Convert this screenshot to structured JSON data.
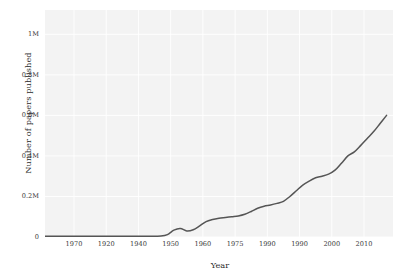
{
  "chart_data": {
    "type": "line",
    "title": "",
    "xlabel": "Year",
    "ylabel": "Number of papers published",
    "xlim": [
      1962,
      2016
    ],
    "ylim": [
      0,
      1120000
    ],
    "grid": true,
    "legend": "none",
    "series_color": "#555555",
    "panel_background": "#f3f3f3",
    "grid_color": "#ffffff",
    "xticks": [
      1970,
      1920,
      1940,
      1950,
      1960,
      1975,
      1990,
      1990,
      2000,
      2010
    ],
    "xtick_labels": [
      "1970",
      "1920",
      "1940",
      "1950",
      "1960",
      "1975",
      "1990",
      "1990",
      "2000",
      "2010"
    ],
    "xtick_positions": [
      1966.5,
      1971.5,
      1976.5,
      1981.5,
      1986.5,
      1991.5,
      1996.5,
      2001.5,
      2006.5,
      2011.5
    ],
    "yticks": [
      0,
      200000,
      400000,
      600000,
      800000,
      1000000
    ],
    "ytick_labels": [
      "0",
      "0.2M",
      "0.4M",
      "0.6M",
      "0.8M",
      "1M"
    ],
    "x": [
      1962,
      1964,
      1966,
      1968,
      1970,
      1972,
      1974,
      1976,
      1978,
      1980,
      1981,
      1982,
      1983,
      1984,
      1985,
      1986,
      1987,
      1988,
      1989,
      1990,
      1991,
      1992,
      1993,
      1994,
      1995,
      1996,
      1997,
      1998,
      1999,
      2000,
      2001,
      2002,
      2003,
      2004,
      2005,
      2006,
      2007,
      2008,
      2009,
      2010,
      2011,
      2012,
      2013,
      2014,
      2015
    ],
    "y": [
      4000,
      4000,
      4000,
      4000,
      4000,
      4000,
      4000,
      4000,
      4000,
      5000,
      12000,
      34000,
      42000,
      30000,
      36000,
      55000,
      76000,
      86000,
      92000,
      96000,
      100000,
      104000,
      112000,
      126000,
      142000,
      152000,
      158000,
      166000,
      176000,
      200000,
      228000,
      256000,
      276000,
      292000,
      300000,
      310000,
      330000,
      364000,
      400000,
      420000,
      452000,
      486000,
      520000,
      560000,
      600000
    ]
  },
  "axes": {
    "xlabel": "Year",
    "ylabel": "Number of papers published"
  }
}
